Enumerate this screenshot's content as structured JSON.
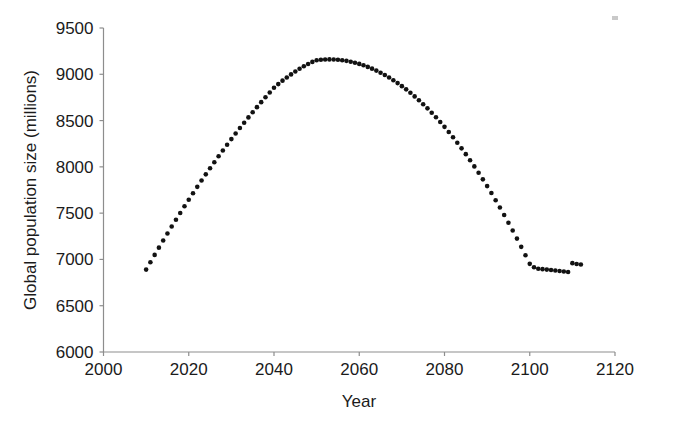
{
  "chart_data": {
    "type": "scatter",
    "title": "",
    "subtitle": "",
    "xlabel": "Year",
    "ylabel": "Global population size (millions)",
    "xlim": [
      2000,
      2120
    ],
    "ylim": [
      6000,
      9500
    ],
    "xticks": [
      2000,
      2020,
      2040,
      2060,
      2080,
      2100,
      2120
    ],
    "xtick_labels": [
      "2000",
      "2020",
      "2040",
      "2060",
      "2080",
      "2100",
      "2120"
    ],
    "yticks": [
      6000,
      6500,
      7000,
      7500,
      8000,
      8500,
      9000,
      9500
    ],
    "ytick_labels": [
      "6000",
      "6500",
      "7000",
      "7500",
      "8000",
      "8500",
      "9000",
      "9500"
    ],
    "grid": false,
    "legend": null,
    "marker": "filled-circle",
    "marker_color": "#121212",
    "series": [
      {
        "name": "Global population projection",
        "x": [
          2010,
          2011,
          2012,
          2013,
          2014,
          2015,
          2016,
          2017,
          2018,
          2019,
          2020,
          2021,
          2022,
          2023,
          2024,
          2025,
          2026,
          2027,
          2028,
          2029,
          2030,
          2031,
          2032,
          2033,
          2034,
          2035,
          2036,
          2037,
          2038,
          2039,
          2040,
          2041,
          2042,
          2043,
          2044,
          2045,
          2046,
          2047,
          2048,
          2049,
          2050,
          2051,
          2052,
          2053,
          2054,
          2055,
          2056,
          2057,
          2058,
          2059,
          2060,
          2061,
          2062,
          2063,
          2064,
          2065,
          2066,
          2067,
          2068,
          2069,
          2070,
          2071,
          2072,
          2073,
          2074,
          2075,
          2076,
          2077,
          2078,
          2079,
          2080,
          2081,
          2082,
          2083,
          2084,
          2085,
          2086,
          2087,
          2088,
          2089,
          2090,
          2091,
          2092,
          2093,
          2094,
          2095,
          2096,
          2097,
          2098,
          2099,
          2100,
          2101,
          2102,
          2103,
          2104,
          2105,
          2106,
          2107,
          2108,
          2109,
          2110,
          2111,
          2112
        ],
        "y": [
          6890,
          6970,
          7049,
          7127,
          7204,
          7280,
          7355,
          7429,
          7502,
          7574,
          7645,
          7715,
          7784,
          7852,
          7919,
          7985,
          8050,
          8114,
          8177,
          8239,
          8300,
          8360,
          8419,
          8477,
          8534,
          8590,
          8645,
          8699,
          8752,
          8804,
          8855,
          8894,
          8931,
          8966,
          8999,
          9030,
          9059,
          9086,
          9111,
          9134,
          9152,
          9157,
          9160,
          9161,
          9160,
          9157,
          9152,
          9145,
          9136,
          9125,
          9112,
          9097,
          9080,
          9061,
          9040,
          9017,
          8992,
          8965,
          8936,
          8905,
          8872,
          8837,
          8800,
          8761,
          8720,
          8677,
          8632,
          8585,
          8536,
          8485,
          8432,
          8377,
          8320,
          8261,
          8200,
          8137,
          8072,
          8005,
          7936,
          7865,
          7792,
          7717,
          7640,
          7561,
          7480,
          7397,
          7312,
          7225,
          7136,
          7045,
          6952,
          6915,
          6900,
          6895,
          6890,
          6885,
          6880,
          6875,
          6870,
          6865,
          6960,
          6950,
          6945
        ]
      }
    ]
  },
  "axes": {
    "x_axis_name": "year-axis",
    "y_axis_name": "population-axis"
  }
}
